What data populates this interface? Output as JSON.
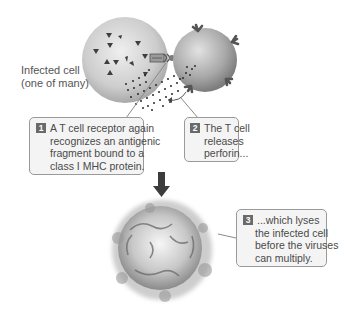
{
  "figure": {
    "infected_cell_label": [
      "Infected cell",
      "(one of many)"
    ],
    "callouts": [
      {
        "number": "1",
        "lines": [
          "A T cell receptor again",
          "recognizes an antigenic",
          "fragment bound to a",
          "class I MHC protein."
        ]
      },
      {
        "number": "2",
        "lines": [
          "The T cell",
          "releases",
          "perforin..."
        ]
      },
      {
        "number": "3",
        "lines": [
          "...which lyses",
          "the infected cell",
          "before the viruses",
          "can multiply."
        ]
      }
    ],
    "colors": {
      "cell_fill": "#cfcfcf",
      "tcell_fill": "#b3b3b3",
      "callout_fill": "#f4f4f4",
      "callout_border": "#9a9a9a",
      "badge": "#6a6a6a",
      "arrow": "#3c3c3c"
    }
  }
}
